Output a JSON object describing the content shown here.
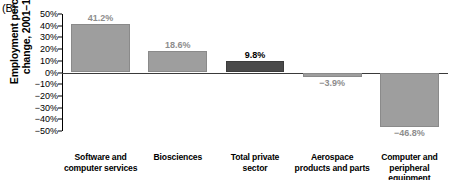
{
  "panel": {
    "label": "(B)"
  },
  "axis": {
    "ylabel": "Employment percent\nchange, 2001–16",
    "ticks": [
      "50%",
      "40%",
      "30%",
      "20%",
      "10%",
      "0%",
      "−10%",
      "−20%",
      "−30%",
      "−40%",
      "−50%"
    ]
  },
  "colors": {
    "bar": "#9e9e9e",
    "bar_highlight": "#4a4a4a",
    "label": "#8d8d8d",
    "label_highlight": "#000000",
    "axis": "#000000"
  },
  "chart_data": {
    "type": "bar",
    "title": "(B)",
    "xlabel": "",
    "ylabel": "Employment percent change, 2001–16",
    "ylim": [
      -50,
      50
    ],
    "ytick_step": 10,
    "grid": false,
    "legend": "none",
    "zero_line": true,
    "categories": [
      "Software and computer services",
      "Biosciences",
      "Total private sector",
      "Aerospace products and parts",
      "Computer and peripheral equipment"
    ],
    "category_lines": [
      [
        "Software and",
        "computer services"
      ],
      [
        "Biosciences"
      ],
      [
        "Total private",
        "sector"
      ],
      [
        "Aerospace",
        "products and parts"
      ],
      [
        "Computer and",
        "peripheral equipment"
      ]
    ],
    "values": [
      41.2,
      18.6,
      9.8,
      -3.9,
      -46.8
    ],
    "value_labels": [
      "41.2%",
      "18.6%",
      "9.8%",
      "−3.9%",
      "−46.8%"
    ],
    "highlight_index": 2
  }
}
